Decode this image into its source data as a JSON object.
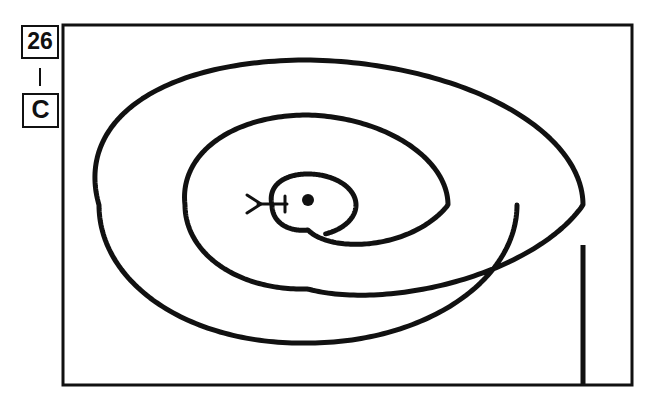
{
  "figure": {
    "kind": "patent-line-drawing",
    "background_color": "#ffffff",
    "ink_color": "#111111",
    "frame": {
      "name": "drawing-border",
      "x": 63,
      "y": 25,
      "width": 569,
      "height": 360,
      "stroke_width": 3,
      "fill": "#ffffff"
    },
    "labels": [
      {
        "id": "figure-number",
        "text": "26",
        "box": {
          "x": 22,
          "y": 26,
          "width": 36,
          "height": 32
        },
        "font_size": 23,
        "stroke_width": 2
      },
      {
        "id": "view-letter",
        "text": "C",
        "box": {
          "x": 23,
          "y": 94,
          "width": 35,
          "height": 33
        },
        "font_size": 25,
        "stroke_width": 2
      }
    ],
    "connector": {
      "name": "label-connector-line",
      "x": 40,
      "y1": 68,
      "y2": 86,
      "stroke_width": 2
    },
    "spiral": {
      "name": "spiral-coil",
      "stroke_width": 5,
      "turns": 3,
      "center": {
        "x": 308,
        "y": 205
      },
      "outer_tail": {
        "x": 583,
        "y_start": 245,
        "y_end": 385
      },
      "extents": {
        "outer_left": 99,
        "outer_top": 60,
        "outer_bottom": 343,
        "outer_right": 583,
        "middle_left": 185,
        "middle_top": 115,
        "middle_bottom": 289,
        "middle_right": 448,
        "inner_left": 272,
        "inner_top": 174,
        "inner_bottom": 230,
        "inner_right": 356
      }
    },
    "center_dot": {
      "name": "center-point-marker",
      "cx": 308,
      "cy": 200,
      "r": 6
    },
    "pointer": {
      "name": "arrow-pointer",
      "chevron_tip_x": 261,
      "chevron_back_x": 247,
      "chevron_half_height": 9,
      "shaft_x1": 258,
      "shaft_x2": 287,
      "shaft_y": 204,
      "tick_x": 285,
      "tick_y1": 196,
      "tick_y2": 212,
      "stroke_width": 3
    }
  }
}
